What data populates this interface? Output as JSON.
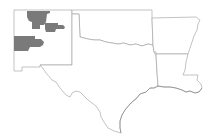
{
  "map": {
    "type": "choropleth",
    "region": "South-Central United States",
    "states": [
      "New Mexico",
      "Texas",
      "Oklahoma",
      "Arkansas",
      "Louisiana"
    ],
    "highlight_color": "#7a7a7a",
    "border_color": "#9a9a9a",
    "background": "#ffffff",
    "highlighted_areas": [
      {
        "state": "New Mexico",
        "label": "northwest-central counties"
      },
      {
        "state": "New Mexico",
        "label": "north-central county"
      },
      {
        "state": "New Mexico",
        "label": "west-central counties"
      }
    ]
  }
}
